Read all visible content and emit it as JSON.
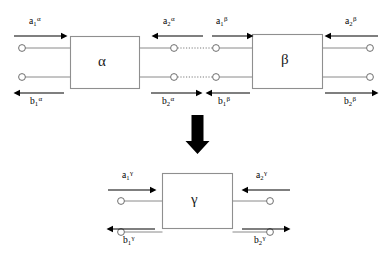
{
  "diagram": {
    "background_color": "#ffffff",
    "wire_color": "#8a8a8a",
    "arrow_color": "#000000",
    "box_border_color": "#8f8f8f"
  },
  "top_stage": {
    "blocks": [
      {
        "id": "alpha",
        "label": "α"
      },
      {
        "id": "beta",
        "label": "β"
      }
    ],
    "wave_labels": [
      {
        "id": "a1-alpha",
        "base": "a",
        "sub": "1",
        "sup": "α",
        "direction": "right",
        "position": "top-left"
      },
      {
        "id": "a2-alpha",
        "base": "a",
        "sub": "2",
        "sup": "α",
        "direction": "left",
        "position": "top-middle-left"
      },
      {
        "id": "a1-beta",
        "base": "a",
        "sub": "1",
        "sup": "β",
        "direction": "right",
        "position": "top-middle-right"
      },
      {
        "id": "a2-beta",
        "base": "a",
        "sub": "2",
        "sup": "β",
        "direction": "left",
        "position": "top-right"
      },
      {
        "id": "b1-alpha",
        "base": "b",
        "sub": "1",
        "sup": "α",
        "direction": "left",
        "position": "bottom-left"
      },
      {
        "id": "b2-alpha",
        "base": "b",
        "sub": "2",
        "sup": "α",
        "direction": "right",
        "position": "bottom-middle-left"
      },
      {
        "id": "b1-beta",
        "base": "b",
        "sub": "1",
        "sup": "β",
        "direction": "left",
        "position": "bottom-middle-right"
      },
      {
        "id": "b2-beta",
        "base": "b",
        "sub": "2",
        "sup": "β",
        "direction": "right",
        "position": "bottom-right"
      }
    ]
  },
  "transition": {
    "id": "equivalence-arrow",
    "glyph": "↓",
    "direction": "down",
    "color": "#000000"
  },
  "bottom_stage": {
    "blocks": [
      {
        "id": "gamma",
        "label": "γ"
      }
    ],
    "wave_labels": [
      {
        "id": "a1-gamma",
        "base": "a",
        "sub": "1",
        "sup": "γ",
        "direction": "right",
        "position": "top-left"
      },
      {
        "id": "a2-gamma",
        "base": "a",
        "sub": "2",
        "sup": "γ",
        "direction": "left",
        "position": "top-right"
      },
      {
        "id": "b1-gamma",
        "base": "b",
        "sub": "1",
        "sup": "γ",
        "direction": "left",
        "position": "bottom-left"
      },
      {
        "id": "b2-gamma",
        "base": "b",
        "sub": "2",
        "sup": "γ",
        "direction": "right",
        "position": "bottom-right"
      }
    ]
  }
}
